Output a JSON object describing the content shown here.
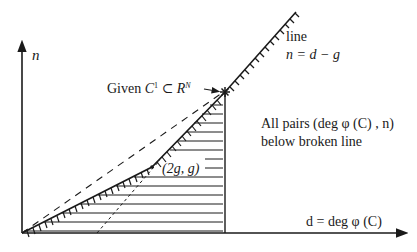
{
  "diagram": {
    "axes": {
      "y_label": "n",
      "x_label": "d = deg φ (C)"
    },
    "annotations": {
      "line_label": "line",
      "line_equation": "n = d − g",
      "given_prefix": "Given ",
      "given_c": "C",
      "given_c_sup": "1",
      "given_subset": " ⊂ ",
      "given_r": "R",
      "given_r_sup": "N",
      "kink_point": "(2g, g)",
      "region_text_line1": "All pairs (deg φ (C) , n)",
      "region_text_line2": "below broken line"
    },
    "colors": {
      "ink": "#1a1a1a",
      "background": "#ffffff"
    }
  }
}
